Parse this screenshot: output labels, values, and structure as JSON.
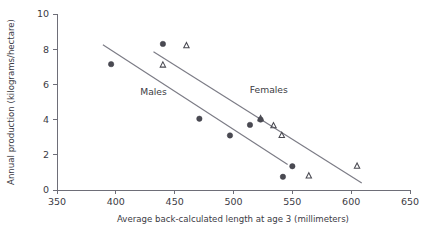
{
  "chart_data": {
    "type": "scatter",
    "title": "",
    "xlabel": "Average back-calculated length at age 3 (millimeters)",
    "ylabel": "Annual production (kilograms/hectare)",
    "xlim": [
      350,
      650
    ],
    "ylim": [
      0,
      10
    ],
    "xticks": [
      350,
      400,
      450,
      500,
      550,
      600,
      650
    ],
    "yticks": [
      0,
      2,
      4,
      6,
      8,
      10
    ],
    "grid": false,
    "legend_position": "inline-annotation",
    "annotations": [
      {
        "text": "Males",
        "x": 432,
        "y": 5.4
      },
      {
        "text": "Females",
        "x": 530,
        "y": 5.5
      }
    ],
    "series": [
      {
        "name": "Males",
        "marker": "filled-circle",
        "color": "#4a4a52",
        "points": [
          {
            "x": 396,
            "y": 7.15
          },
          {
            "x": 440,
            "y": 8.3
          },
          {
            "x": 471,
            "y": 4.05
          },
          {
            "x": 497,
            "y": 3.1
          },
          {
            "x": 514,
            "y": 3.7
          },
          {
            "x": 523,
            "y": 4.0
          },
          {
            "x": 542,
            "y": 0.75
          },
          {
            "x": 550,
            "y": 1.35
          }
        ],
        "trend_line": {
          "x1": 389,
          "y1": 8.25,
          "x2": 546,
          "y2": 1.45
        }
      },
      {
        "name": "Females",
        "marker": "open-triangle",
        "color": "#4a4a52",
        "points": [
          {
            "x": 440,
            "y": 7.1
          },
          {
            "x": 460,
            "y": 8.2
          },
          {
            "x": 523,
            "y": 4.05
          },
          {
            "x": 534,
            "y": 3.65
          },
          {
            "x": 541,
            "y": 3.1
          },
          {
            "x": 564,
            "y": 0.8
          },
          {
            "x": 605,
            "y": 1.35
          }
        ],
        "trend_line": {
          "x1": 432,
          "y1": 7.85,
          "x2": 609,
          "y2": 0.4
        }
      }
    ]
  },
  "colors": {
    "marker": "#4a4a52",
    "trend": "#7b7b85",
    "axis": "#6e6e78",
    "text": "#3b3b44",
    "background": "#ffffff"
  }
}
